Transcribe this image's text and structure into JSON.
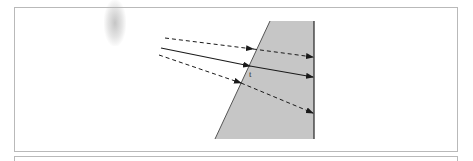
{
  "figure": {
    "type": "refraction-diagram",
    "medium": {
      "color": "#c6c6c6",
      "edge_color": "#444444",
      "points": [
        [
          270,
          21
        ],
        [
          314,
          21
        ],
        [
          314,
          139
        ],
        [
          215,
          139
        ]
      ]
    },
    "rays": [
      {
        "name": "upper-ray",
        "style": "dashed",
        "incident": [
          [
            165,
            38
          ],
          [
            253,
            49
          ]
        ],
        "refracted": [
          [
            253,
            49
          ],
          [
            313,
            57
          ]
        ]
      },
      {
        "name": "center-ray",
        "style": "solid",
        "incident": [
          [
            161,
            48
          ],
          [
            250,
            66
          ]
        ],
        "refracted": [
          [
            250,
            66
          ],
          [
            313,
            77
          ]
        ]
      },
      {
        "name": "lower-ray",
        "style": "dashed",
        "incident": [
          [
            159,
            55
          ],
          [
            241,
            83
          ]
        ],
        "refracted": [
          [
            241,
            83
          ],
          [
            313,
            113
          ]
        ]
      }
    ],
    "label": "t",
    "line_color": "#1a1a1a"
  }
}
